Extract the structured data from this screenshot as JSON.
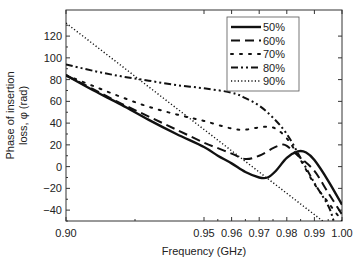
{
  "chart_data": {
    "type": "line",
    "title": "",
    "xlabel": "Frequency (GHz)",
    "ylabel_line1": "Phase of insertion",
    "ylabel_line2": "loss, φ (rad)",
    "xlim": [
      0.9,
      1.0
    ],
    "ylim": [
      -50,
      144
    ],
    "xticks": [
      0.9,
      0.95,
      0.96,
      0.97,
      0.98,
      0.99,
      1.0
    ],
    "xtick_labels": [
      "0.90",
      "0.95",
      "0.96",
      "0.97",
      "0.98",
      "0.99",
      "1.00"
    ],
    "yticks": [
      -40,
      -20,
      0,
      20,
      40,
      60,
      80,
      100,
      120
    ],
    "ytick_labels": [
      "−40",
      "−20",
      "0",
      "20",
      "40",
      "60",
      "80",
      "100",
      "120"
    ],
    "grid": false,
    "legend_position": "upper right",
    "series": [
      {
        "name": "50%",
        "style": "solid",
        "x": [
          0.9,
          0.91,
          0.92,
          0.93,
          0.94,
          0.95,
          0.955,
          0.96,
          0.965,
          0.97,
          0.973,
          0.976,
          0.98,
          0.984,
          0.987,
          0.99,
          0.995,
          1.0
        ],
        "y": [
          84,
          70,
          57,
          43,
          30,
          18,
          10,
          3,
          -5,
          -10,
          -10,
          -4,
          8,
          14,
          13,
          6,
          -13,
          -35
        ]
      },
      {
        "name": "60%",
        "style": "dashed",
        "x": [
          0.9,
          0.91,
          0.92,
          0.93,
          0.94,
          0.95,
          0.955,
          0.96,
          0.965,
          0.97,
          0.975,
          0.978,
          0.98,
          0.985,
          0.99,
          0.995,
          1.0
        ],
        "y": [
          84,
          71,
          58,
          46,
          34,
          22,
          17,
          12,
          7,
          10,
          17,
          20,
          19,
          8,
          -4,
          -24,
          -44
        ]
      },
      {
        "name": "70%",
        "style": "dotted-sparse",
        "x": [
          0.9,
          0.91,
          0.92,
          0.93,
          0.94,
          0.95,
          0.96,
          0.965,
          0.97,
          0.975,
          0.98,
          0.985,
          0.99,
          0.995,
          1.0
        ],
        "y": [
          84,
          74,
          64,
          55,
          48,
          42,
          35,
          34,
          36,
          36,
          26,
          6,
          -16,
          -33,
          -50
        ]
      },
      {
        "name": "80%",
        "style": "dash-dot-dot",
        "x": [
          0.9,
          0.91,
          0.92,
          0.93,
          0.94,
          0.95,
          0.96,
          0.965,
          0.97,
          0.975,
          0.98,
          0.985,
          0.99,
          0.995,
          0.997
        ],
        "y": [
          94,
          88,
          83,
          79,
          75,
          72,
          68,
          63,
          56,
          45,
          30,
          8,
          -15,
          -36,
          -50
        ]
      },
      {
        "name": "90%",
        "style": "dotted",
        "x": [
          0.9,
          0.993
        ],
        "y": [
          132,
          -50
        ]
      }
    ]
  }
}
